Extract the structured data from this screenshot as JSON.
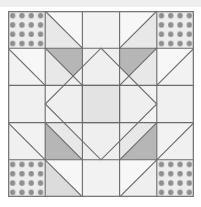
{
  "canvas": {
    "width": 201,
    "height": 207,
    "background": "#ffffff",
    "top_band_color": "#efefef"
  },
  "artwork": {
    "name": "quilt-block",
    "kind": "pieced quilt block diagram",
    "x": 8,
    "y": 11,
    "width": 186,
    "height": 186,
    "grid_rows": 5,
    "grid_cols": 5,
    "cell_size": 37.2
  },
  "palette": {
    "white": "#f7f7f7",
    "off_white": "#f2f2f2",
    "light_gray": "#e8e8e8",
    "light_gray_2": "#e3e3e3",
    "medium_gray": "#c8c8c8",
    "medium_dark_gray": "#b6b6b6",
    "dot_background": "#ececec",
    "dot_color": "#8f8f8f",
    "seam_line": "#6b6b6b",
    "border_line": "#7a7a7a"
  },
  "line": {
    "seam_width": 1.1,
    "border_width": 1.3
  },
  "dots": {
    "rows": 4,
    "cols": 4,
    "radius": 2.7,
    "spacing": 9.3,
    "offset": 5.1
  },
  "patches": {
    "corner_dotted": [
      "top-left",
      "top-right",
      "bottom-left",
      "bottom-right"
    ],
    "outer_hst": [
      "r1c2",
      "r1c4",
      "r5c2",
      "r5c4",
      "r2c1",
      "r4c1",
      "r2c5",
      "r4c5"
    ],
    "inner_dark_hst": [
      "r2c2",
      "r2c4",
      "r4c2",
      "r4c4"
    ],
    "center_diamond": "square-on-point spanning rows 2-4, cols 2-4",
    "center_square": "r3c3"
  },
  "labels": {
    "alt": "Symmetric five-by-five pieced quilt block with dotted corner squares, half-square triangles and a central square-on-point diamond."
  }
}
